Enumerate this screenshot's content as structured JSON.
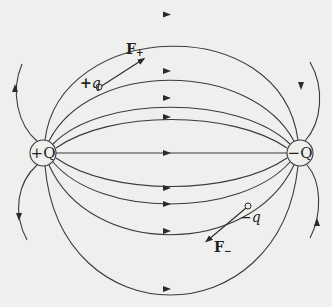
{
  "diagram": {
    "charges": {
      "positive_source": {
        "label": "+Q"
      },
      "negative_source": {
        "label": "−Q"
      },
      "positive_test": {
        "label_sign": "+",
        "label_var": "q"
      },
      "negative_test": {
        "label_sign": "−",
        "label_var": "q"
      }
    },
    "forces": {
      "on_positive": {
        "label": "F",
        "subscript": "+"
      },
      "on_negative": {
        "label": "F",
        "subscript": "−"
      }
    },
    "field_line_count": 13,
    "colors": {
      "line": "#3a3a3a",
      "background": "#efefed",
      "text": "#222222"
    }
  }
}
